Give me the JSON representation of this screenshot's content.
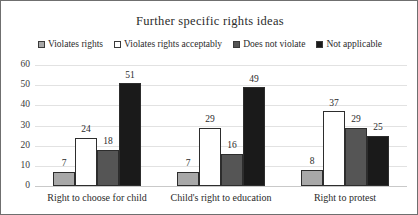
{
  "chart_data": {
    "type": "bar",
    "title": "Further specific rights ideas",
    "xlabel": "",
    "ylabel": "",
    "ylim": [
      0,
      60
    ],
    "yticks": [
      0,
      10,
      20,
      30,
      40,
      50,
      60
    ],
    "grid": true,
    "legend_position": "top",
    "categories": [
      "Right to choose for child",
      "Child's right to education",
      "Right to protest"
    ],
    "series": [
      {
        "name": "Violates rights",
        "color": "#a8a8a8",
        "values": [
          7,
          7,
          8
        ]
      },
      {
        "name": "Violates rights acceptably",
        "color": "#ffffff",
        "values": [
          24,
          29,
          37
        ]
      },
      {
        "name": "Does not violate",
        "color": "#555555",
        "values": [
          18,
          16,
          29
        ]
      },
      {
        "name": "Not applicable",
        "color": "#1a1a1a",
        "values": [
          51,
          49,
          25
        ]
      }
    ]
  }
}
